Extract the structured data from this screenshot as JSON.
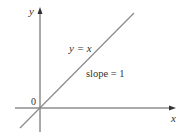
{
  "diagram": {
    "axes": {
      "x_label": "x",
      "y_label": "y",
      "origin_label": "0"
    },
    "line": {
      "equation": "y = x",
      "slope_label": "slope = 1",
      "color": "#8a8a8a"
    },
    "colors": {
      "axis": "#555555",
      "text": "#333333"
    }
  }
}
